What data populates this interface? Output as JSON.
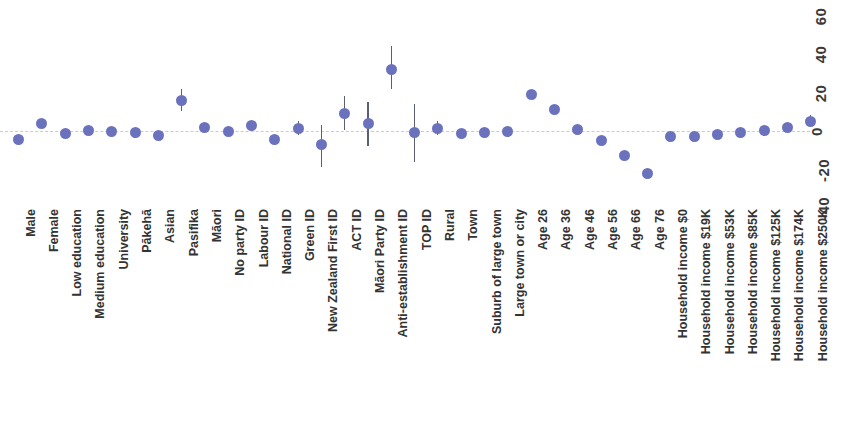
{
  "chart_data": {
    "type": "scatter",
    "title": "",
    "subtitle": "",
    "xlabel": "",
    "ylabel": "",
    "ylim": [
      -40,
      60
    ],
    "yticks": [
      60,
      40,
      20,
      0,
      -20,
      -40
    ],
    "grid": false,
    "legend": null,
    "zero_reference_line": 0,
    "point_color": "#6b72bd",
    "errorbar_color": "#5b5f73",
    "categories": [
      "Male",
      "Female",
      "Low education",
      "Medium education",
      "University",
      "Pākehā",
      "Asian",
      "Pasifika",
      "Māori",
      "No party ID",
      "Labour ID",
      "National ID",
      "Green ID",
      "New Zealand First ID",
      "ACT ID",
      "Māori Party ID",
      "Anti-establishment ID",
      "TOP ID",
      "Rural",
      "Town",
      "Suburb of large town",
      "Large town or city",
      "Age 26",
      "Age 36",
      "Age 46",
      "Age 56",
      "Age 66",
      "Age 76",
      "Household income $0",
      "Household income $19K",
      "Household income $53K",
      "Household income $85K",
      "Household income $125K",
      "Household income $174K",
      "Household income $250K"
    ],
    "values": [
      -4.5,
      4.0,
      -1.5,
      0.5,
      0.0,
      -1.0,
      -2.5,
      16.0,
      2.0,
      -0.5,
      3.0,
      -4.5,
      1.5,
      -7.0,
      9.0,
      4.0,
      32.0,
      -1.0,
      1.5,
      -1.5,
      -1.0,
      0.0,
      19.0,
      11.0,
      1.0,
      -5.0,
      -12.5,
      -22.0,
      -3.0,
      -3.0,
      -2.0,
      -1.0,
      0.5,
      2.0,
      5.0
    ],
    "ci_lower": [
      -4.5,
      4.0,
      -4.0,
      0.5,
      0.0,
      -3.5,
      -2.5,
      10.5,
      2.0,
      -0.5,
      3.0,
      -4.5,
      -2.0,
      -18.5,
      0.5,
      -8.0,
      22.0,
      -16.0,
      -2.0,
      -1.5,
      -1.0,
      0.0,
      19.0,
      11.0,
      1.0,
      -5.0,
      -12.5,
      -22.0,
      -3.0,
      -3.0,
      -2.0,
      -1.0,
      0.5,
      2.0,
      2.0
    ],
    "ci_upper": [
      -4.5,
      4.0,
      1.5,
      0.5,
      0.0,
      1.5,
      -2.5,
      22.0,
      2.0,
      -0.5,
      3.0,
      -4.5,
      5.0,
      3.0,
      18.0,
      15.0,
      44.0,
      14.0,
      5.0,
      -1.5,
      -1.0,
      0.0,
      19.0,
      11.0,
      1.0,
      -5.0,
      -12.5,
      -22.0,
      -3.0,
      -3.0,
      -2.0,
      -1.0,
      0.5,
      2.0,
      8.5
    ]
  }
}
